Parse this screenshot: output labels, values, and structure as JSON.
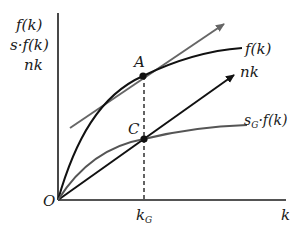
{
  "diagram": {
    "y_axis_labels": [
      "f(k)",
      "s·f(k)",
      "nk"
    ],
    "x_axis_label": "k",
    "origin_label": "O",
    "curves": {
      "f": {
        "label": "f(k)"
      },
      "nk": {
        "label": "nk"
      },
      "sf": {
        "label_main": "s",
        "label_sub": "G",
        "label_rest": "·f(k)"
      }
    },
    "points": {
      "A": {
        "label": "A"
      },
      "C": {
        "label": "C"
      }
    },
    "k_golden": {
      "main": "k",
      "sub": "G"
    },
    "colors": {
      "axis": "#1a1a1a",
      "f_curve": "#111111",
      "nk_line": "#111111",
      "sf_curve": "#555555",
      "tangent": "#666666",
      "dashed": "#222222"
    }
  }
}
